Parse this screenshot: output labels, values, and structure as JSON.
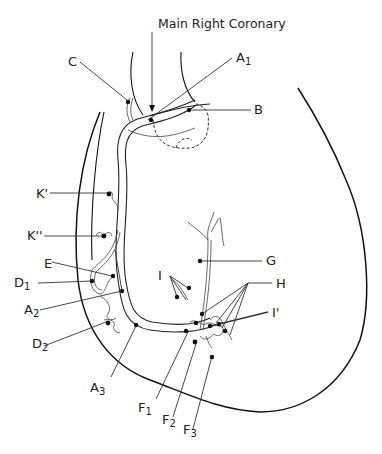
{
  "title": "Main Right Coronary",
  "labels": {
    "A1": {
      "main": "A",
      "sub": "1"
    },
    "A2": {
      "main": "A",
      "sub": "2"
    },
    "A3": {
      "main": "A",
      "sub": "3"
    },
    "B": {
      "main": "B",
      "sub": ""
    },
    "C": {
      "main": "C",
      "sub": ""
    },
    "D1": {
      "main": "D",
      "sub": "1"
    },
    "D2": {
      "main": "D",
      "sub": "2"
    },
    "E": {
      "main": "E",
      "sub": ""
    },
    "F1": {
      "main": "F",
      "sub": "1"
    },
    "F2": {
      "main": "F",
      "sub": "2"
    },
    "F3": {
      "main": "F",
      "sub": "3"
    },
    "G": {
      "main": "G",
      "sub": ""
    },
    "H": {
      "main": "H",
      "sub": ""
    },
    "I": {
      "main": "I",
      "sub": ""
    },
    "I_prime": {
      "main": "I'",
      "sub": ""
    },
    "K_prime": {
      "main": "K'",
      "sub": ""
    },
    "K_double_prime": {
      "main": "K''",
      "sub": ""
    }
  }
}
